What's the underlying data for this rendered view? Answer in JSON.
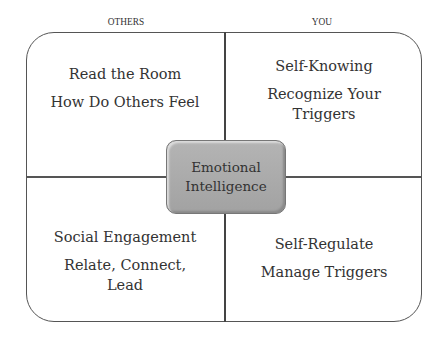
{
  "columns": {
    "left_label": "OTHERS",
    "right_label": "YOU"
  },
  "center": {
    "line1": "Emotional",
    "line2": "Intelligence",
    "fill": "#a8a8a8"
  },
  "quadrants": {
    "top_left": {
      "title": "Read the Room",
      "subtitle": "How Do Others Feel"
    },
    "top_right": {
      "title": "Self-Knowing",
      "subtitle_line1": "Recognize Your",
      "subtitle_line2": "Triggers"
    },
    "bottom_left": {
      "title": "Social Engagement",
      "subtitle_line1": "Relate, Connect,",
      "subtitle_line2": "Lead"
    },
    "bottom_right": {
      "title": "Self-Regulate",
      "subtitle": "Manage Triggers"
    }
  }
}
